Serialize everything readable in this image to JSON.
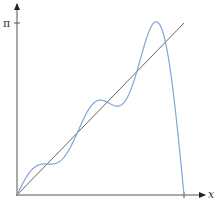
{
  "chart_data": {
    "type": "line",
    "title": "",
    "xlabel": "x",
    "ylabel": "",
    "x_ticks": [
      {
        "value": 3.14159,
        "label": "π"
      }
    ],
    "y_ticks": [
      {
        "value": 3.14159,
        "label": "π"
      }
    ],
    "xlim": [
      0,
      3.14159
    ],
    "ylim": [
      0,
      3.14159
    ],
    "grid": false,
    "legend": null,
    "series": [
      {
        "name": "y = x",
        "color": "#666666",
        "kind": "line",
        "x": [
          0,
          3.14159
        ],
        "values": [
          0,
          3.14159
        ]
      },
      {
        "name": "Fourier partial sum of x (5 terms)",
        "color": "#7fa7d8",
        "kind": "curve",
        "terms": 5,
        "x": [
          0,
          0.5,
          0.8,
          1.0,
          1.3,
          1.6,
          1.9,
          2.2,
          2.5,
          2.7,
          2.9,
          3.14159
        ],
        "values": [
          0,
          0.4,
          0.95,
          1.08,
          1.2,
          1.47,
          1.98,
          2.09,
          2.6,
          3.3,
          2.2,
          0
        ]
      }
    ]
  },
  "axes": {
    "x_label": "x",
    "x_tick_label": "π",
    "y_tick_label": "π"
  },
  "colors": {
    "axis": "#555555",
    "reference_line": "#666666",
    "curve": "#7fa7d8"
  }
}
